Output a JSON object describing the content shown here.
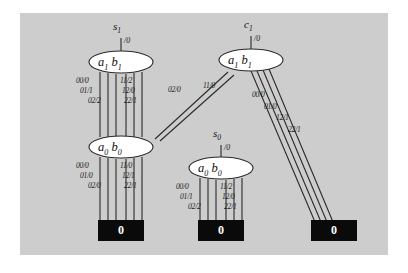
{
  "figure": {
    "background_color": "#cdcdcd",
    "page_color": "#ffffff",
    "line_color": "#2a2a2a",
    "node_fill": "#ffffff",
    "leaf_fill": "#0a0a0a",
    "leaf_text_color": "#ffffff"
  },
  "nodes": [
    {
      "id": "n1",
      "label_a": "a",
      "label_a_sub": "1",
      "label_b": "b",
      "label_b_sub": "1",
      "input_label": "s",
      "input_sub": "1",
      "input_output": "/0"
    },
    {
      "id": "n2",
      "label_a": "a",
      "label_a_sub": "1",
      "label_b": "b",
      "label_b_sub": "1",
      "input_label": "c",
      "input_sub": "1",
      "input_output": "/0"
    },
    {
      "id": "n3",
      "label_a": "a",
      "label_a_sub": "0",
      "label_b": "b",
      "label_b_sub": "0"
    },
    {
      "id": "n4",
      "label_a": "a",
      "label_a_sub": "0",
      "label_b": "b",
      "label_b_sub": "0",
      "input_label": "s",
      "input_sub": "0",
      "input_output": "/0"
    }
  ],
  "node1_edge_labels": {
    "left": [
      "00/0",
      "01/1",
      "02/2"
    ],
    "right": [
      "11/2",
      "12/0",
      "22/1"
    ]
  },
  "node2_edge_labels": {
    "to_node3": [
      "02/0",
      "11/0"
    ],
    "to_leaf": [
      "00/0",
      "01/0",
      "12/1",
      "22/1"
    ]
  },
  "node3_edge_labels": {
    "left": [
      "00/0",
      "01/0",
      "02/0"
    ],
    "right": [
      "11/0",
      "12/1",
      "22/1"
    ]
  },
  "node4_edge_labels": {
    "left": [
      "00/0",
      "01/1",
      "02/2"
    ],
    "right": [
      "11/2",
      "12/0",
      "22/1"
    ]
  },
  "leaves": [
    {
      "id": "leaf1",
      "value": "0"
    },
    {
      "id": "leaf2",
      "value": "0"
    },
    {
      "id": "leaf3",
      "value": "0"
    }
  ]
}
